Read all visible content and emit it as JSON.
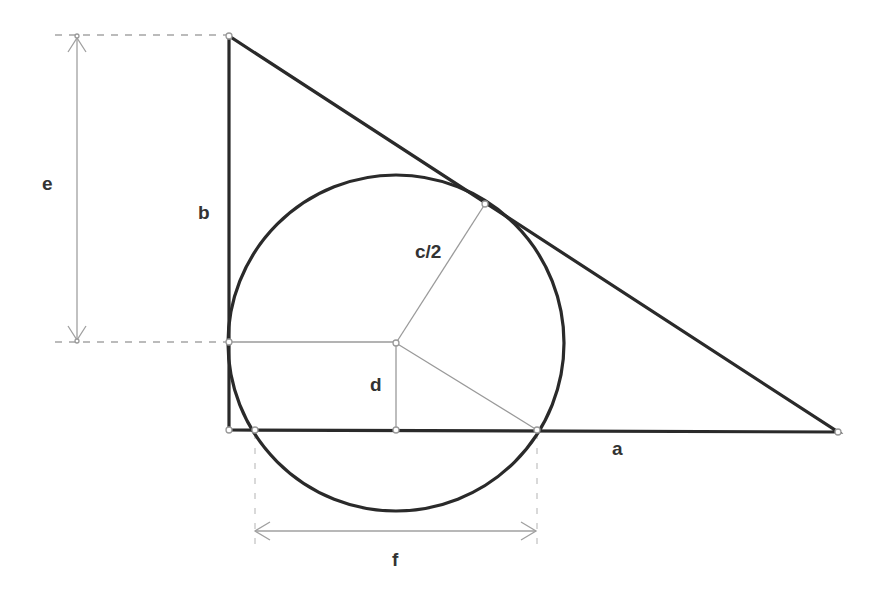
{
  "diagram": {
    "title": "",
    "colors": {
      "background": "#ffffff",
      "main_stroke": "#2a2a2a",
      "construction_stroke": "#9a9a9a",
      "label": "#333333"
    },
    "labels": {
      "leg_vertical": "b",
      "leg_horizontal": "a",
      "radius": "c/2",
      "height_center": "d",
      "dimension_vertical": "e",
      "dimension_horizontal": "f"
    },
    "shapes": {
      "triangle": {
        "vertices": [
          [
            229,
            36
          ],
          [
            229,
            430
          ],
          [
            838,
            432
          ]
        ]
      },
      "circle": {
        "center": [
          396,
          343
        ],
        "radius": 168
      },
      "tangent_point": [
        485,
        204
      ],
      "base_intersections": [
        [
          255,
          430
        ],
        [
          537,
          430
        ]
      ]
    }
  }
}
